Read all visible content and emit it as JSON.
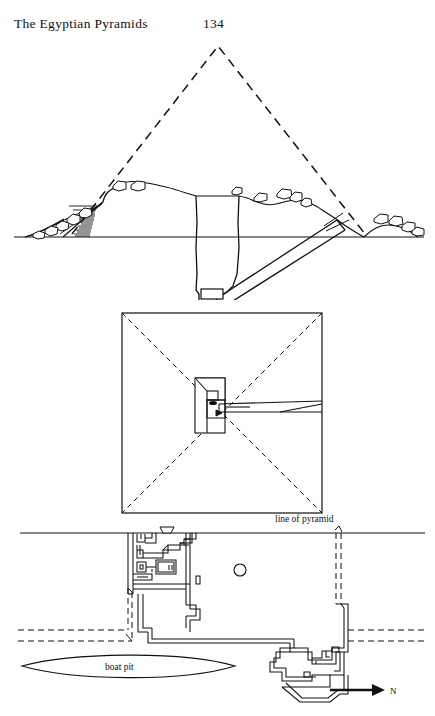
{
  "page": {
    "running_head": "The Egyptian Pyramids",
    "page_number": "134",
    "width": 435,
    "height": 716,
    "background_color": "#ffffff",
    "ink_color": "#111111"
  },
  "figures": [
    {
      "id": "cross-section",
      "name": "pyramid-cross-section",
      "description": "Cross-section through a ruined pyramid showing original profile as dashed lines, present rubble mound, central shaft, descending corridor and subterranean chamber.",
      "elements": [
        {
          "name": "original-pyramid-outline",
          "style": "dashed",
          "apex": [
            218,
            12
          ],
          "base_left": [
            72,
            200
          ],
          "base_right": [
            365,
            200
          ]
        },
        {
          "name": "ground-line",
          "style": "solid",
          "from": [
            14,
            203
          ],
          "to": [
            424,
            203
          ]
        },
        {
          "name": "rubble-mound-profile",
          "style": "solid"
        },
        {
          "name": "stone-blocks-debris",
          "style": "solid",
          "count": 16
        },
        {
          "name": "hatched-casing-slope",
          "style": "hatched",
          "lines": 14
        },
        {
          "name": "central-shaft",
          "style": "solid"
        },
        {
          "name": "descending-corridor",
          "style": "solid"
        },
        {
          "name": "subterranean-chamber",
          "style": "solid"
        }
      ]
    },
    {
      "id": "ground-plan",
      "name": "pyramid-ground-plan",
      "description": "Square plan of the pyramid with dashed diagonals from the corners meeting at the centre, a central chamber block and an entrance corridor running to the east face.",
      "elements": [
        {
          "name": "pyramid-square-outline",
          "style": "solid",
          "x": 122,
          "y": 13,
          "width": 200,
          "height": 200
        },
        {
          "name": "diagonal-nw-se",
          "style": "dashed"
        },
        {
          "name": "diagonal-ne-sw",
          "style": "dashed"
        },
        {
          "name": "central-chamber-block",
          "style": "solid"
        },
        {
          "name": "entrance-corridor",
          "style": "solid"
        },
        {
          "name": "shaft-opening",
          "style": "solid"
        }
      ]
    },
    {
      "id": "site-plan",
      "name": "pyramid-site-plan",
      "description": "Site plan: the pyramid base line at the top, mortuary temple to the west, a well shaft, the causeway shown dashed, a boat pit and the valley temple to the east, with a north arrow.",
      "labels": {
        "line_of_pyramid": "line of pyramid",
        "boat_pit": "boat pit",
        "north": "N"
      },
      "elements": [
        {
          "name": "line-of-pyramid",
          "style": "solid",
          "from": [
            20,
            21
          ],
          "to": [
            425,
            21
          ]
        },
        {
          "name": "mortuary-temple-plan",
          "style": "double-line-walls"
        },
        {
          "name": "well-shaft-circle",
          "style": "solid",
          "center": [
            240,
            58
          ],
          "radius": 6
        },
        {
          "name": "causeway-north-wall",
          "style": "dashed"
        },
        {
          "name": "causeway-south-wall",
          "style": "dashed"
        },
        {
          "name": "boat-pit-outline",
          "style": "lens-shape"
        },
        {
          "name": "valley-temple-plan",
          "style": "double-line-walls"
        },
        {
          "name": "north-arrow",
          "style": "solid-arrow"
        }
      ]
    }
  ]
}
